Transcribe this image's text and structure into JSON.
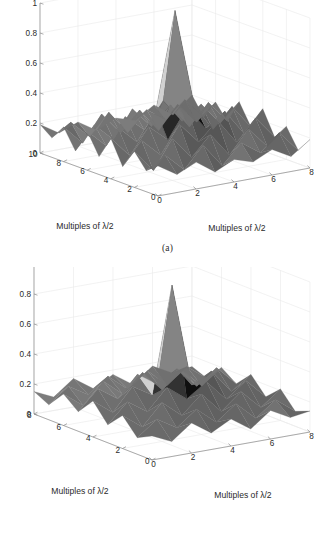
{
  "figure": {
    "kind": "two-panel 3d surface plots",
    "background_color": "#ffffff",
    "grid_color": "#e9e9e9",
    "axis_color": "#8a8a8a",
    "surface_colormap": "gray"
  },
  "panels": [
    {
      "id": "a",
      "caption": "(a)",
      "xlabel": "Multiples of λ/2",
      "ylabel": "Multiples of λ/2",
      "x_ticks": [
        "0",
        "2",
        "4",
        "6",
        "8"
      ],
      "y_ticks": [
        "10",
        "8",
        "6",
        "4",
        "2",
        "0"
      ],
      "z_ticks": [
        "0",
        "0.2",
        "0.4",
        "0.6",
        "0.8",
        "1"
      ]
    },
    {
      "id": "b",
      "caption": "(b)",
      "xlabel": "Multiples of λ/2",
      "ylabel": "Multiples of λ/2",
      "x_ticks": [
        "0",
        "2",
        "4",
        "6",
        "8"
      ],
      "y_ticks": [
        "8",
        "6",
        "4",
        "2",
        "0"
      ],
      "z_ticks": [
        "0",
        "0.2",
        "0.4",
        "0.6",
        "0.8",
        "1"
      ]
    }
  ],
  "chart_data": [
    {
      "type": "surface",
      "panel": "a",
      "title": "",
      "xlabel": "Multiples of λ/2",
      "ylabel": "Multiples of λ/2",
      "zlabel": "",
      "xlim": [
        0,
        8
      ],
      "ylim": [
        0,
        10
      ],
      "zlim": [
        0,
        1
      ],
      "xticks": [
        0,
        2,
        4,
        6,
        8
      ],
      "yticks": [
        0,
        2,
        4,
        6,
        8,
        10
      ],
      "zticks": [
        0,
        0.2,
        0.4,
        0.6,
        0.8,
        1
      ],
      "grid": true,
      "legend": "none",
      "colormap": "gray",
      "peak": {
        "x": 4,
        "y": 5,
        "z": 1.0
      },
      "x": [
        0,
        1,
        2,
        3,
        4,
        5,
        6,
        7,
        8
      ],
      "y": [
        0,
        1,
        2,
        3,
        4,
        5,
        6,
        7,
        8,
        9,
        10
      ],
      "z": [
        [
          0.2,
          0.12,
          0.18,
          0.09,
          0.15,
          0.11,
          0.17,
          0.1,
          0.19
        ],
        [
          0.14,
          0.22,
          0.1,
          0.24,
          0.08,
          0.21,
          0.12,
          0.23,
          0.09
        ],
        [
          0.24,
          0.09,
          0.28,
          0.13,
          0.26,
          0.1,
          0.25,
          0.11,
          0.22
        ],
        [
          0.11,
          0.26,
          0.14,
          0.32,
          0.18,
          0.3,
          0.13,
          0.27,
          0.12
        ],
        [
          0.27,
          0.13,
          0.3,
          0.19,
          0.38,
          0.22,
          0.31,
          0.14,
          0.28
        ],
        [
          0.12,
          0.29,
          0.17,
          0.36,
          1.0,
          0.35,
          0.16,
          0.29,
          0.13
        ],
        [
          0.26,
          0.14,
          0.31,
          0.2,
          0.37,
          0.21,
          0.3,
          0.15,
          0.27
        ],
        [
          0.1,
          0.25,
          0.13,
          0.31,
          0.17,
          0.29,
          0.12,
          0.26,
          0.11
        ],
        [
          0.23,
          0.1,
          0.27,
          0.12,
          0.25,
          0.09,
          0.24,
          0.1,
          0.21
        ],
        [
          0.13,
          0.21,
          0.09,
          0.23,
          0.07,
          0.2,
          0.11,
          0.22,
          0.08
        ],
        [
          0.19,
          0.11,
          0.16,
          0.08,
          0.14,
          0.1,
          0.18,
          0.09,
          0.2
        ]
      ]
    },
    {
      "type": "surface",
      "panel": "b",
      "title": "",
      "xlabel": "Multiples of λ/2",
      "ylabel": "Multiples of λ/2",
      "zlabel": "",
      "xlim": [
        0,
        8
      ],
      "ylim": [
        0,
        8
      ],
      "zlim": [
        0,
        1
      ],
      "xticks": [
        0,
        2,
        4,
        6,
        8
      ],
      "yticks": [
        0,
        2,
        4,
        6,
        8
      ],
      "zticks": [
        0,
        0.2,
        0.4,
        0.6,
        0.8,
        1
      ],
      "grid": true,
      "legend": "none",
      "colormap": "gray",
      "peak": {
        "x": 4,
        "y": 4,
        "z": 0.92
      },
      "x": [
        0,
        1,
        2,
        3,
        4,
        5,
        6,
        7,
        8
      ],
      "y": [
        0,
        1,
        2,
        3,
        4,
        5,
        6,
        7,
        8
      ],
      "z": [
        [
          0.16,
          0.1,
          0.2,
          0.11,
          0.18,
          0.09,
          0.19,
          0.12,
          0.14
        ],
        [
          0.11,
          0.21,
          0.13,
          0.23,
          0.12,
          0.22,
          0.1,
          0.2,
          0.1
        ],
        [
          0.22,
          0.12,
          0.26,
          0.15,
          0.27,
          0.13,
          0.24,
          0.11,
          0.21
        ],
        [
          0.12,
          0.25,
          0.16,
          0.3,
          0.2,
          0.29,
          0.15,
          0.25,
          0.12
        ],
        [
          0.24,
          0.14,
          0.29,
          0.21,
          0.92,
          0.23,
          0.3,
          0.14,
          0.23
        ],
        [
          0.13,
          0.26,
          0.17,
          0.31,
          0.22,
          0.3,
          0.16,
          0.26,
          0.13
        ],
        [
          0.21,
          0.11,
          0.25,
          0.14,
          0.26,
          0.12,
          0.23,
          0.1,
          0.2
        ],
        [
          0.1,
          0.2,
          0.12,
          0.22,
          0.11,
          0.21,
          0.09,
          0.19,
          0.09
        ],
        [
          0.15,
          0.09,
          0.19,
          0.1,
          0.17,
          0.08,
          0.18,
          0.11,
          0.13
        ]
      ]
    }
  ]
}
